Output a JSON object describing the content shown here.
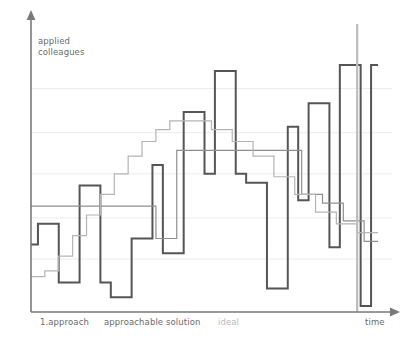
{
  "figure": {
    "title": "",
    "background": "#ffffff",
    "width": 415,
    "height": 345
  },
  "axes": {
    "y_label_line1": "applied",
    "y_label_line2": "colleagues",
    "y_axis_name": "applied colleagues",
    "x_axis_name": "time",
    "x_tick_labels": [
      {
        "text": "1.approach",
        "color": "#6b6b6b"
      },
      {
        "text": "approachable solution",
        "color": "#6b6b6b"
      },
      {
        "text": "ideal",
        "color": "#b9b9b9"
      },
      {
        "text": "time",
        "color": "#6b6b6b"
      }
    ],
    "axis_color": "#7a7a7a",
    "grid_color": "#ededed"
  },
  "colors": {
    "series_actual": "#555555",
    "series_scope": "#8f8f8f",
    "series_ideal": "#b4b4b4",
    "grid": "#ededed",
    "axis": "#7a7a7a",
    "text": "#6b6b6b",
    "text_muted": "#b9b9b9",
    "marker_line": "#bcbcbc"
  },
  "chart_data": {
    "type": "line",
    "subtype": "step-area-burnup",
    "title": "",
    "xlabel": "time",
    "ylabel": "applied colleagues",
    "xlim": [
      0,
      100
    ],
    "ylim": [
      0,
      100
    ],
    "grid": true,
    "grid_axis": "y",
    "gridlines_y": [
      18,
      32,
      47,
      61,
      76
    ],
    "legend": "none",
    "annotations": [
      {
        "text": "1.approach",
        "x": 5,
        "y": -8
      },
      {
        "text": "approachable solution",
        "x": 26,
        "y": -8
      },
      {
        "text": "ideal",
        "x": 57,
        "y": -8
      },
      {
        "text": "time",
        "x": 97,
        "y": -8
      }
    ],
    "series": [
      {
        "name": "1.approach",
        "color": "#555555",
        "width": 2,
        "style": "step",
        "x": [
          0,
          2,
          2,
          5,
          5,
          8,
          8,
          11,
          11,
          14,
          14,
          17,
          17,
          20,
          20,
          23,
          23,
          26,
          26,
          29,
          29,
          32,
          32,
          35,
          35,
          38,
          38,
          41,
          41,
          44,
          44,
          47,
          47,
          50,
          50,
          53,
          53,
          56,
          56,
          59,
          59,
          62,
          62,
          65,
          65,
          68,
          68,
          71,
          71,
          74,
          74,
          77,
          77,
          80,
          80,
          83,
          83,
          86,
          86,
          89,
          89,
          92,
          92,
          95,
          95,
          98,
          98,
          100
        ],
        "y": [
          23,
          23,
          30,
          30,
          30,
          30,
          10,
          10,
          10,
          10,
          43,
          43,
          43,
          43,
          10,
          10,
          5,
          5,
          5,
          5,
          25,
          25,
          25,
          25,
          50,
          50,
          20,
          20,
          20,
          20,
          68,
          68,
          68,
          68,
          47,
          47,
          82,
          82,
          82,
          82,
          47,
          47,
          44,
          44,
          44,
          44,
          8,
          8,
          8,
          8,
          63,
          63,
          38,
          38,
          71,
          71,
          71,
          71,
          22,
          22,
          84,
          84,
          84,
          84,
          2,
          2,
          84,
          84
        ]
      },
      {
        "name": "approachable solution",
        "color": "#8f8f8f",
        "width": 1.2,
        "style": "step",
        "x": [
          0,
          6,
          6,
          12,
          12,
          18,
          18,
          24,
          24,
          30,
          30,
          36,
          36,
          42,
          42,
          48,
          48,
          54,
          54,
          60,
          60,
          66,
          66,
          72,
          72,
          78,
          78,
          84,
          84,
          90,
          90,
          96,
          96,
          100
        ],
        "y": [
          36,
          36,
          36,
          36,
          36,
          36,
          36,
          36,
          36,
          36,
          36,
          36,
          25,
          25,
          55,
          55,
          55,
          55,
          55,
          55,
          55,
          55,
          55,
          55,
          55,
          55,
          40,
          40,
          37,
          37,
          31,
          31,
          24,
          24
        ]
      },
      {
        "name": "ideal",
        "color": "#b4b4b4",
        "width": 1.2,
        "style": "step",
        "x": [
          0,
          4,
          4,
          8,
          8,
          12,
          12,
          16,
          16,
          20,
          20,
          24,
          24,
          28,
          28,
          32,
          32,
          36,
          36,
          40,
          40,
          46,
          46,
          52,
          52,
          58,
          58,
          64,
          64,
          70,
          70,
          76,
          76,
          82,
          82,
          88,
          88,
          94,
          94,
          100
        ],
        "y": [
          12,
          12,
          14,
          14,
          19,
          19,
          26,
          26,
          33,
          33,
          40,
          40,
          47,
          47,
          53,
          53,
          58,
          58,
          62,
          62,
          65,
          65,
          65,
          65,
          62,
          62,
          58,
          58,
          53,
          53,
          46,
          46,
          40,
          40,
          34,
          34,
          30,
          30,
          27,
          27
        ]
      }
    ],
    "marker": {
      "name": "end-of-time-marker",
      "x": 94,
      "color": "#bcbcbc"
    }
  }
}
